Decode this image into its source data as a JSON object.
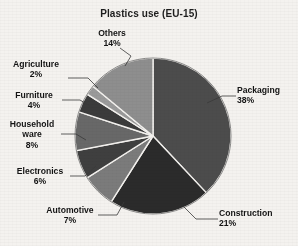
{
  "chart_data": {
    "type": "pie",
    "title": "Plastics use (EU-15)",
    "xlabel": "",
    "ylabel": "",
    "legend_position": "none",
    "grid": false,
    "categories": [
      "Packaging",
      "Construction",
      "Automotive",
      "Electronics",
      "Household ware",
      "Furniture",
      "Agriculture",
      "Others"
    ],
    "values": [
      38,
      21,
      7,
      6,
      8,
      4,
      2,
      14
    ],
    "value_unit": "%",
    "start_angle_deg": 0,
    "direction": "clockwise",
    "slices": [
      {
        "label": "Packaging",
        "value": 38,
        "pct_text": "38%",
        "color": "#4c4c4c"
      },
      {
        "label": "Construction",
        "value": 21,
        "pct_text": "21%",
        "color": "#2b2b2b"
      },
      {
        "label": "Automotive",
        "value": 7,
        "pct_text": "7%",
        "color": "#7b7b7b"
      },
      {
        "label": "Electronics",
        "value": 6,
        "pct_text": "6%",
        "color": "#3f3f3f"
      },
      {
        "label": "Household ware",
        "value": 8,
        "pct_text": "8%",
        "color": "#686868"
      },
      {
        "label": "Furniture",
        "value": 4,
        "pct_text": "4%",
        "color": "#3b3b3b"
      },
      {
        "label": "Agriculture",
        "value": 2,
        "pct_text": "2%",
        "color": "#9a9a9a"
      },
      {
        "label": "Others",
        "value": 14,
        "pct_text": "14%",
        "color": "#8e8e8e"
      }
    ]
  },
  "labels": {
    "packaging_name": "Packaging",
    "packaging_pct": "38%",
    "construction_name": "Construction",
    "construction_pct": "21%",
    "automotive_name": "Automotive",
    "automotive_pct": "7%",
    "electronics_name": "Electronics",
    "electronics_pct": "6%",
    "household_name_line1": "Household",
    "household_name_line2": "ware",
    "household_pct": "8%",
    "furniture_name": "Furniture",
    "furniture_pct": "4%",
    "agriculture_name": "Agriculture",
    "agriculture_pct": "2%",
    "others_name": "Others",
    "others_pct": "14%"
  },
  "style": {
    "background": "#f4f2ef",
    "text_color": "#141414",
    "slice_border": "#f4f2ef",
    "leader_color": "#3a3a3a"
  }
}
